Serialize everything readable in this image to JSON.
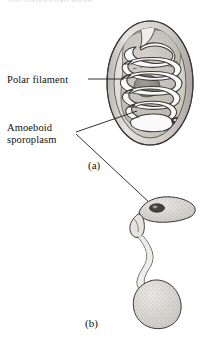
{
  "figure": {
    "title_fragment_cut_off": "microsporidian spore",
    "background_color": "#ffffff",
    "ink_color": "#1a1a1a",
    "stipple_color": "#8a8a8a",
    "shell_fill": "#d8d6d2",
    "sporoplasm_fill": "#c9c6c0",
    "nucleus_fill": "#8f8b85"
  },
  "labels": {
    "polar_filament": "Polar filament",
    "amoeboid_line1": "Amoeboid",
    "amoeboid_line2": "sporoplasm"
  },
  "captions": {
    "panel_a": "(a)",
    "panel_b": "(b)"
  },
  "panels": [
    {
      "id": "a",
      "caption": "(a)",
      "description": "Intact ovoid spore with coiled polar filament surrounding the amoeboid sporoplasm",
      "parts": [
        "spore-wall",
        "polar-filament-coil",
        "sporoplasm",
        "nucleus",
        "posterior-vacuole"
      ]
    },
    {
      "id": "b",
      "caption": "(b)",
      "description": "Discharged spore: extruded polar filament with amoeboid sporoplasm emerging",
      "parts": [
        "amoeboid-sporoplasm",
        "nucleus",
        "extruded-filament",
        "empty-spore-shell"
      ]
    }
  ]
}
